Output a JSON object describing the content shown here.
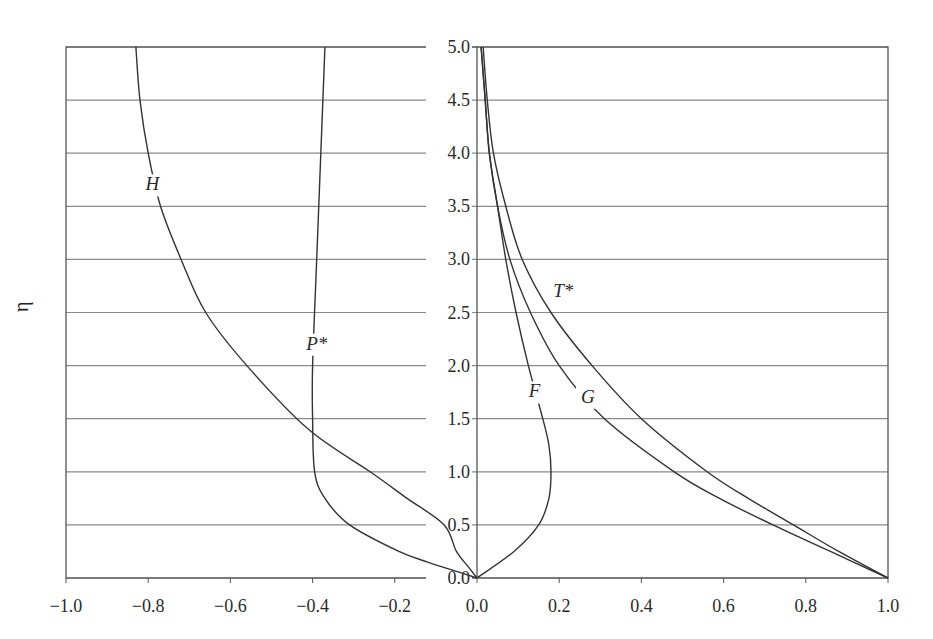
{
  "chart_data": {
    "type": "line",
    "title": "",
    "xlabel": "",
    "ylabel": "η",
    "xlim": [
      -1.0,
      1.0
    ],
    "ylim": [
      0.0,
      5.0
    ],
    "grid": {
      "horizontal": true,
      "vertical": false
    },
    "x_ticks": [
      "-1.0",
      "-0.8",
      "-0.6",
      "-0.4",
      "-0.2",
      "0.0",
      "0.2",
      "0.4",
      "0.6",
      "0.8",
      "1.0"
    ],
    "y_ticks": [
      "0.0",
      "0.5",
      "1.0",
      "1.5",
      "2.0",
      "2.5",
      "3.0",
      "3.5",
      "4.0",
      "4.5",
      "5.0"
    ],
    "series": [
      {
        "name": "H",
        "label_pos": [
          -0.79,
          3.65
        ],
        "eta": [
          0,
          0.1,
          0.25,
          0.5,
          0.75,
          1.0,
          1.4,
          2.0,
          2.5,
          3.0,
          3.5,
          4.0,
          4.5,
          5.0
        ],
        "values": [
          0,
          -0.02,
          -0.05,
          -0.08,
          -0.17,
          -0.26,
          -0.41,
          -0.56,
          -0.66,
          -0.72,
          -0.77,
          -0.8,
          -0.82,
          -0.83
        ]
      },
      {
        "name": "P*",
        "label_pos": [
          -0.39,
          2.15
        ],
        "eta": [
          0,
          0.05,
          0.15,
          0.25,
          0.5,
          0.75,
          1.0,
          1.5,
          2.0,
          3.0,
          4.0,
          5.0
        ],
        "values": [
          0,
          -0.04,
          -0.12,
          -0.19,
          -0.31,
          -0.37,
          -0.395,
          -0.4,
          -0.4,
          -0.39,
          -0.38,
          -0.37
        ]
      },
      {
        "name": "F",
        "label_pos": [
          0.14,
          1.7
        ],
        "eta": [
          0,
          0.25,
          0.5,
          0.75,
          1.0,
          1.25,
          1.5,
          2.0,
          2.5,
          3.0,
          3.5,
          4.0,
          4.5,
          5.0
        ],
        "values": [
          0,
          0.09,
          0.15,
          0.175,
          0.18,
          0.175,
          0.16,
          0.125,
          0.095,
          0.07,
          0.05,
          0.03,
          0.02,
          0.01
        ]
      },
      {
        "name": "G",
        "label_pos": [
          0.27,
          1.65
        ],
        "eta": [
          0,
          0.25,
          0.5,
          0.75,
          1.0,
          1.5,
          2.0,
          2.5,
          3.0,
          3.5,
          4.0,
          4.5,
          5.0
        ],
        "values": [
          1.0,
          0.86,
          0.72,
          0.59,
          0.48,
          0.31,
          0.2,
          0.13,
          0.08,
          0.05,
          0.03,
          0.02,
          0.01
        ]
      },
      {
        "name": "T*",
        "label_pos": [
          0.21,
          2.65
        ],
        "eta": [
          0,
          0.25,
          0.5,
          0.75,
          1.0,
          1.5,
          2.0,
          2.5,
          3.0,
          3.5,
          4.0,
          4.5,
          5.0
        ],
        "values": [
          1.0,
          0.88,
          0.77,
          0.66,
          0.56,
          0.4,
          0.28,
          0.18,
          0.11,
          0.07,
          0.04,
          0.025,
          0.015
        ]
      }
    ]
  }
}
